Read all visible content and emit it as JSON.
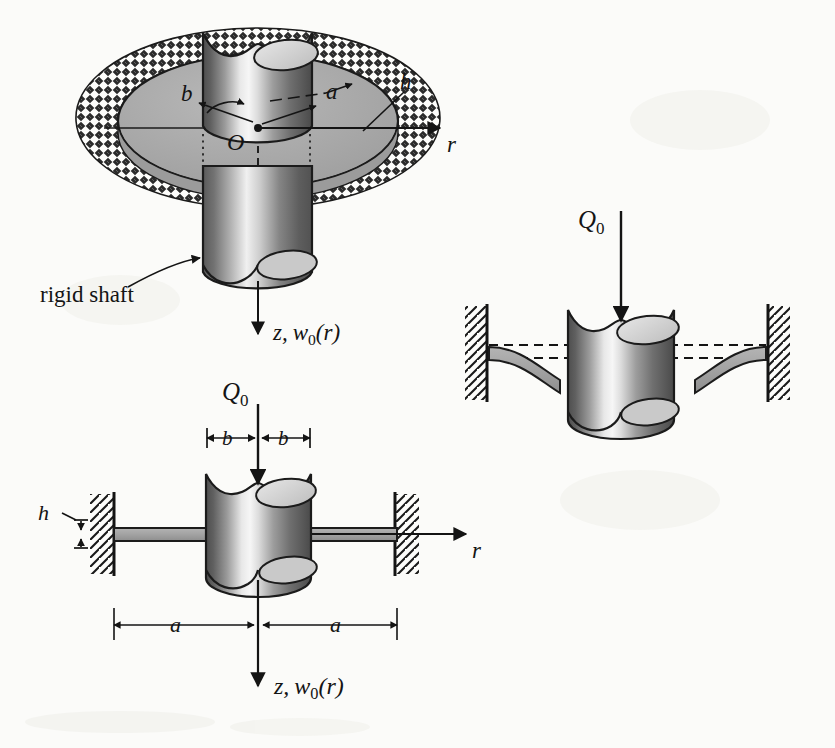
{
  "figure": {
    "caption_absent": true,
    "background_color": "#fbfbf9",
    "ink_color": "#141414",
    "plate_fill": "#a8a8a8",
    "hatch_ring_fill": "#6b6b6b",
    "shaft_light": "#f2f2f2",
    "shaft_dark": "#4a4a4a"
  },
  "views": {
    "top": {
      "name": "three-quarter perspective view of clamped annular plate",
      "labels": {
        "inner_radius": "b",
        "outer_radius": "a",
        "thickness": "h",
        "origin": "O",
        "radial_axis": "r",
        "shaft_note": "rigid shaft",
        "deflection_axis_z": "z,",
        "deflection_axis_w": "w",
        "deflection_axis_w_sub": "0",
        "deflection_axis_w_arg": "(r)"
      }
    },
    "bottom": {
      "name": "undeformed cross-section with dimensions",
      "labels": {
        "load": "Q",
        "load_sub": "0",
        "inner_left": "b",
        "inner_right": "b",
        "outer_left": "a",
        "outer_right": "a",
        "thickness": "h",
        "radial_axis": "r",
        "deflection_axis_z": "z,",
        "deflection_axis_w": "w",
        "deflection_axis_w_sub": "0",
        "deflection_axis_w_arg": "(r)"
      }
    },
    "right": {
      "name": "deformed cross-section under load",
      "labels": {
        "load": "Q",
        "load_sub": "0"
      }
    }
  }
}
